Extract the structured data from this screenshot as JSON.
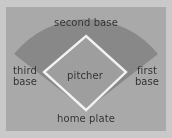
{
  "diagram": {
    "canvas": {
      "width": 172,
      "height": 138
    },
    "colors": {
      "border": "#c9c9c9",
      "field": "#a9a9a9",
      "outfield_arc": "#888888",
      "infield_diamond": "#9e9e9e",
      "base_line": "#f2f2f2",
      "text": "#2f2f2f"
    },
    "geometry": {
      "home_plate": {
        "x": 86,
        "y": 110
      },
      "first_base": {
        "x": 126,
        "y": 72
      },
      "second_base": {
        "x": 86,
        "y": 36
      },
      "third_base": {
        "x": 44,
        "y": 72
      },
      "arc_radius": 84,
      "baseline_width": 2
    },
    "labels": {
      "second_base": "second base",
      "third_base": "third\nbase",
      "pitcher": "pitcher",
      "first_base": "first\nbase",
      "home_plate": "home plate"
    }
  }
}
